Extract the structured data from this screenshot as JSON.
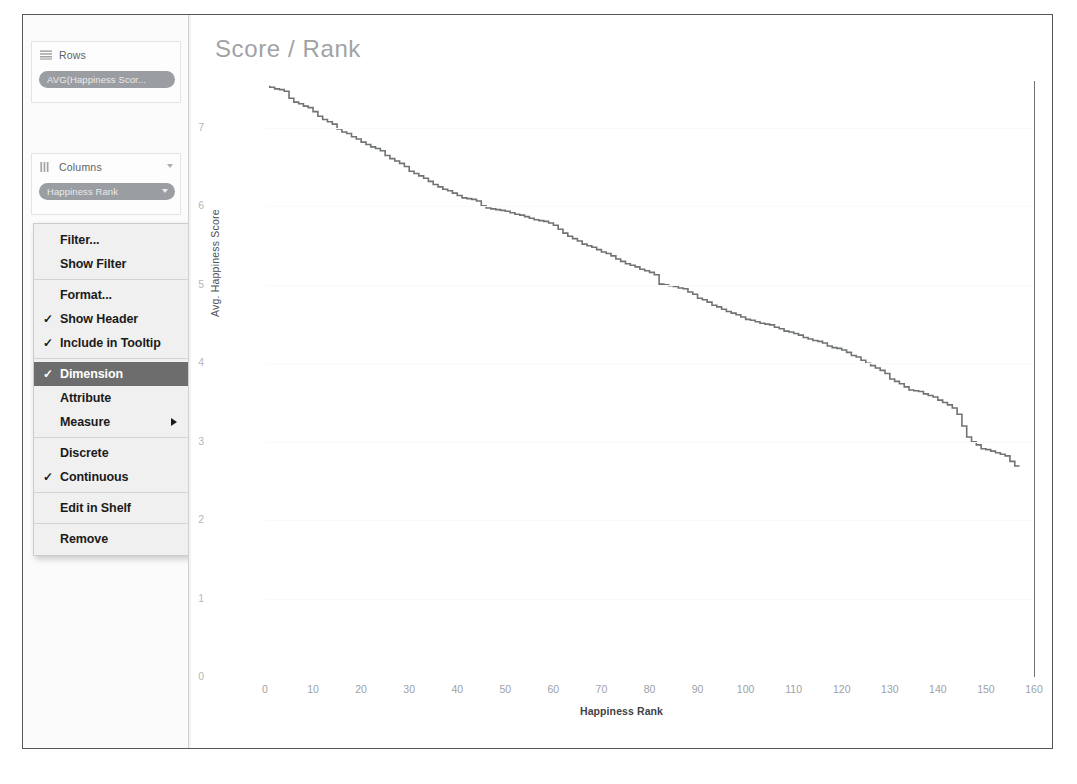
{
  "window": {
    "left_panel": {
      "rows_shelf": {
        "label": "Rows",
        "icon": "rows-shelf-icon",
        "pill": "AVG(Happiness Scor..."
      },
      "columns_shelf": {
        "label": "Columns",
        "icon": "columns-shelf-icon",
        "pill": "Happiness Rank"
      }
    },
    "context_menu": {
      "items": [
        {
          "label": "Filter...",
          "checked": false,
          "selected": false,
          "submenu": false
        },
        {
          "label": "Show Filter",
          "checked": false,
          "selected": false,
          "submenu": false
        },
        {
          "separator": true
        },
        {
          "label": "Format...",
          "checked": false,
          "selected": false,
          "submenu": false
        },
        {
          "label": "Show Header",
          "checked": true,
          "selected": false,
          "submenu": false
        },
        {
          "label": "Include in Tooltip",
          "checked": true,
          "selected": false,
          "submenu": false
        },
        {
          "separator": true
        },
        {
          "label": "Dimension",
          "checked": true,
          "selected": true,
          "submenu": false
        },
        {
          "label": "Attribute",
          "checked": false,
          "selected": false,
          "submenu": false
        },
        {
          "label": "Measure",
          "checked": false,
          "selected": false,
          "submenu": true
        },
        {
          "separator": true
        },
        {
          "label": "Discrete",
          "checked": false,
          "selected": false,
          "submenu": false
        },
        {
          "label": "Continuous",
          "checked": true,
          "selected": false,
          "submenu": false
        },
        {
          "separator": true
        },
        {
          "label": "Edit in Shelf",
          "checked": false,
          "selected": false,
          "submenu": false
        },
        {
          "separator": true
        },
        {
          "label": "Remove",
          "checked": false,
          "selected": false,
          "submenu": false
        }
      ],
      "check_glyph": "✓",
      "selected_bg": "#6d6d6d"
    }
  },
  "chart_data": {
    "type": "line",
    "title": "Score / Rank",
    "xlabel": "Happiness Rank",
    "ylabel": "Avg. Happiness Score",
    "xlim": [
      0,
      160
    ],
    "ylim": [
      0,
      7.6
    ],
    "xticks": [
      0,
      10,
      20,
      30,
      40,
      50,
      60,
      70,
      80,
      90,
      100,
      110,
      120,
      130,
      140,
      150,
      160
    ],
    "yticks": [
      0,
      1,
      2,
      3,
      4,
      5,
      6,
      7
    ],
    "grid": true,
    "legend": "none",
    "line_color": "#6f7376",
    "series": [
      {
        "name": "Avg. Happiness Score",
        "x": [
          1,
          2,
          3,
          4,
          5,
          6,
          7,
          8,
          9,
          10,
          11,
          12,
          13,
          14,
          15,
          16,
          17,
          18,
          19,
          20,
          21,
          22,
          23,
          24,
          25,
          26,
          27,
          28,
          29,
          30,
          31,
          32,
          33,
          34,
          35,
          36,
          37,
          38,
          39,
          40,
          41,
          42,
          43,
          44,
          45,
          46,
          47,
          48,
          49,
          50,
          51,
          52,
          53,
          54,
          55,
          56,
          57,
          58,
          59,
          60,
          61,
          62,
          63,
          64,
          65,
          66,
          67,
          68,
          69,
          70,
          71,
          72,
          73,
          74,
          75,
          76,
          77,
          78,
          79,
          80,
          81,
          82,
          83,
          84,
          85,
          86,
          87,
          88,
          89,
          90,
          91,
          92,
          93,
          94,
          95,
          96,
          97,
          98,
          99,
          100,
          101,
          102,
          103,
          104,
          105,
          106,
          107,
          108,
          109,
          110,
          111,
          112,
          113,
          114,
          115,
          116,
          117,
          118,
          119,
          120,
          121,
          122,
          123,
          124,
          125,
          126,
          127,
          128,
          129,
          130,
          131,
          132,
          133,
          134,
          135,
          136,
          137,
          138,
          139,
          140,
          141,
          142,
          143,
          144,
          145,
          146,
          147,
          148,
          149,
          150,
          151,
          152,
          153,
          154,
          155,
          156,
          157
        ],
        "values": [
          7.54,
          7.52,
          7.5,
          7.49,
          7.47,
          7.38,
          7.33,
          7.31,
          7.28,
          7.26,
          7.21,
          7.15,
          7.11,
          7.08,
          7.05,
          6.99,
          6.95,
          6.93,
          6.89,
          6.86,
          6.82,
          6.79,
          6.76,
          6.74,
          6.71,
          6.65,
          6.61,
          6.58,
          6.55,
          6.51,
          6.45,
          6.42,
          6.39,
          6.36,
          6.32,
          6.28,
          6.25,
          6.22,
          6.2,
          6.17,
          6.14,
          6.11,
          6.1,
          6.09,
          6.07,
          6.01,
          5.98,
          5.97,
          5.96,
          5.95,
          5.94,
          5.92,
          5.9,
          5.89,
          5.87,
          5.85,
          5.83,
          5.82,
          5.81,
          5.79,
          5.76,
          5.71,
          5.66,
          5.62,
          5.59,
          5.56,
          5.52,
          5.5,
          5.48,
          5.45,
          5.42,
          5.4,
          5.37,
          5.33,
          5.3,
          5.27,
          5.25,
          5.23,
          5.2,
          5.18,
          5.16,
          5.13,
          5.01,
          5.0,
          4.99,
          4.98,
          4.96,
          4.95,
          4.91,
          4.88,
          4.83,
          4.81,
          4.78,
          4.74,
          4.72,
          4.69,
          4.66,
          4.64,
          4.62,
          4.59,
          4.56,
          4.55,
          4.53,
          4.51,
          4.5,
          4.49,
          4.46,
          4.44,
          4.41,
          4.4,
          4.38,
          4.36,
          4.33,
          4.31,
          4.29,
          4.28,
          4.26,
          4.22,
          4.2,
          4.19,
          4.17,
          4.14,
          4.1,
          4.08,
          4.04,
          4.0,
          3.97,
          3.94,
          3.91,
          3.87,
          3.8,
          3.77,
          3.74,
          3.7,
          3.66,
          3.65,
          3.64,
          3.61,
          3.59,
          3.57,
          3.53,
          3.5,
          3.47,
          3.43,
          3.35,
          3.2,
          3.06,
          3.0,
          2.96,
          2.91,
          2.9,
          2.88,
          2.86,
          2.84,
          2.82,
          2.75,
          2.69
        ]
      }
    ]
  }
}
